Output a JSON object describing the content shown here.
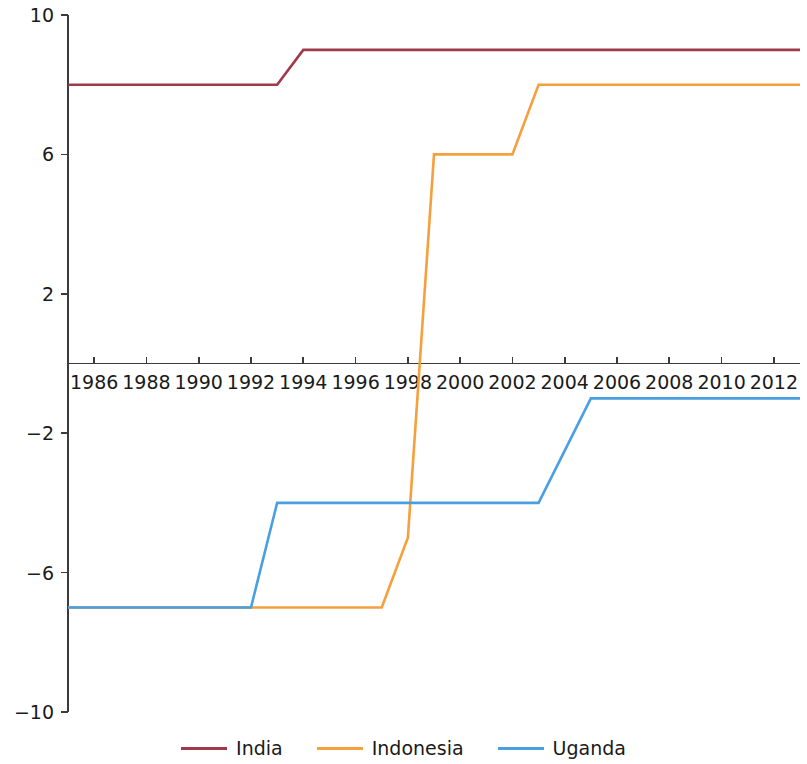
{
  "chart_data": {
    "type": "line",
    "title": "",
    "subtitle": "",
    "xlabel": "",
    "ylabel": "",
    "xlim": [
      1985,
      2013
    ],
    "ylim": [
      -10,
      10
    ],
    "grid": false,
    "legend_position": "bottom-center",
    "x_ticks": [
      1986,
      1988,
      1990,
      1992,
      1994,
      1996,
      1998,
      2000,
      2002,
      2004,
      2006,
      2008,
      2010,
      2012
    ],
    "x_tick_labels": [
      "1986",
      "1988",
      "1990",
      "1992",
      "1994",
      "1996",
      "1998",
      "2000",
      "2002",
      "2004",
      "2006",
      "2008",
      "2010",
      "2012"
    ],
    "y_ticks": [
      10,
      6,
      2,
      -2,
      -6,
      -10
    ],
    "y_tick_labels": [
      "10",
      "6",
      "2",
      "−2",
      "−6",
      "−10"
    ],
    "x_axis_position_value": 0,
    "series": [
      {
        "name": "India",
        "color": "#A03A4A",
        "x": [
          1985,
          1993,
          1994,
          2013
        ],
        "values": [
          8,
          8,
          9,
          9
        ]
      },
      {
        "name": "Indonesia",
        "color": "#F5A03C",
        "x": [
          1985,
          1992,
          1997,
          1998,
          1999,
          2002,
          2003,
          2013
        ],
        "values": [
          -7,
          -7,
          -7,
          -5,
          6,
          6,
          8,
          8
        ]
      },
      {
        "name": "Uganda",
        "color": "#4A9FE0",
        "x": [
          1985,
          1992,
          1993,
          2003,
          2005,
          2013
        ],
        "values": [
          -7,
          -7,
          -4,
          -4,
          -1,
          -1
        ]
      }
    ]
  },
  "legend": {
    "entries": [
      {
        "label": "India",
        "color": "#A03A4A"
      },
      {
        "label": "Indonesia",
        "color": "#F5A03C"
      },
      {
        "label": "Uganda",
        "color": "#4A9FE0"
      }
    ]
  }
}
